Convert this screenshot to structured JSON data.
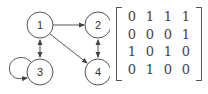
{
  "graph": {
    "nodes": [
      {
        "id": "1",
        "label": "1",
        "cx": 40,
        "cy": 25
      },
      {
        "id": "2",
        "label": "2",
        "cx": 98,
        "cy": 25
      },
      {
        "id": "3",
        "label": "3",
        "cx": 40,
        "cy": 72
      },
      {
        "id": "4",
        "label": "4",
        "cx": 98,
        "cy": 72
      }
    ],
    "edges": [
      {
        "from": "1",
        "to": "2",
        "type": "directed"
      },
      {
        "from": "1",
        "to": "4",
        "type": "directed"
      },
      {
        "from": "1",
        "to": "3",
        "type": "bidirectional"
      },
      {
        "from": "2",
        "to": "4",
        "type": "bidirectional"
      },
      {
        "from": "3",
        "to": "3",
        "type": "self-loop"
      }
    ]
  },
  "matrix": {
    "rows": [
      [
        "0",
        "1",
        "1",
        "1"
      ],
      [
        "0",
        "0",
        "0",
        "1"
      ],
      [
        "1",
        "0",
        "1",
        "0"
      ],
      [
        "0",
        "1",
        "0",
        "0"
      ]
    ]
  },
  "colors": {
    "stroke": "#555555",
    "text": "#333333",
    "background": "#ffffff"
  }
}
